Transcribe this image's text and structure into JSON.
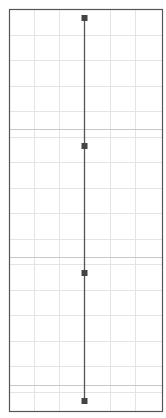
{
  "diagram": {
    "type": "vertical-timeline-grid",
    "frame": {
      "left": 9,
      "top": 9,
      "right": 162,
      "bottom": 411
    },
    "grid": {
      "columns_x": [
        34,
        59,
        110,
        135
      ],
      "row_spacing": 25.5,
      "minor_color": "#e4e4e4",
      "major_color": "#c8c8c8",
      "major_rows_y": [
        129,
        257,
        385
      ]
    },
    "axis": {
      "x": 84,
      "color": "#555555"
    },
    "markers": [
      {
        "x": 84,
        "y": 18
      },
      {
        "x": 84,
        "y": 146
      },
      {
        "x": 84,
        "y": 273
      },
      {
        "x": 84,
        "y": 401
      }
    ],
    "colors": {
      "frame": "#555555",
      "marker": "#444444",
      "background": "#ffffff"
    }
  }
}
